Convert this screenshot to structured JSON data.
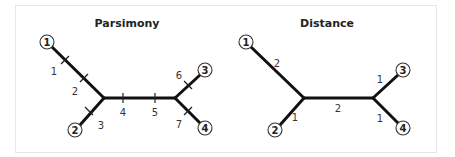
{
  "panels": [
    {
      "title": "Parsimony",
      "nodes": [
        "1",
        "2",
        "3",
        "4"
      ],
      "change_labels": [
        "1",
        "2",
        "3",
        "4",
        "5",
        "6",
        "7"
      ]
    },
    {
      "title": "Distance",
      "nodes": [
        "1",
        "2",
        "3",
        "4"
      ],
      "branch_lengths": {
        "to_1": "2",
        "to_2": "1",
        "internal": "2",
        "to_3": "1",
        "to_4": "1"
      }
    }
  ],
  "colors": {
    "branch": "#111111",
    "frame": "#e6e6e6"
  }
}
